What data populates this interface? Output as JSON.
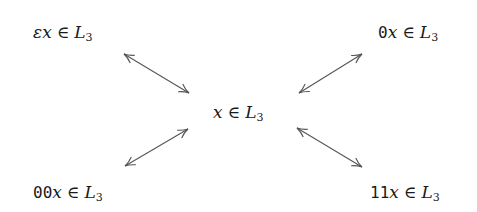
{
  "diagram": {
    "nodes": {
      "center": {
        "prefix": "",
        "var": "x",
        "rel": "∈",
        "lang": "L",
        "sub": "3"
      },
      "top_left": {
        "prefix": "ε",
        "prefix_style": "italic",
        "var": "x",
        "rel": "∈",
        "lang": "L",
        "sub": "3"
      },
      "top_right": {
        "prefix": "0",
        "prefix_style": "mono",
        "var": "x",
        "rel": "∈",
        "lang": "L",
        "sub": "3"
      },
      "bottom_left": {
        "prefix": "00",
        "prefix_style": "mono",
        "var": "x",
        "rel": "∈",
        "lang": "L",
        "sub": "3"
      },
      "bottom_right": {
        "prefix": "11",
        "prefix_style": "mono",
        "var": "x",
        "rel": "∈",
        "lang": "L",
        "sub": "3"
      }
    },
    "edges": [
      {
        "from": "center",
        "to": "top_left",
        "type": "bidirectional"
      },
      {
        "from": "center",
        "to": "top_right",
        "type": "bidirectional"
      },
      {
        "from": "center",
        "to": "bottom_left",
        "type": "bidirectional"
      },
      {
        "from": "center",
        "to": "bottom_right",
        "type": "bidirectional"
      }
    ],
    "colors": {
      "text": "#1a1a1a",
      "arrow": "#555555",
      "background": "#ffffff"
    }
  }
}
